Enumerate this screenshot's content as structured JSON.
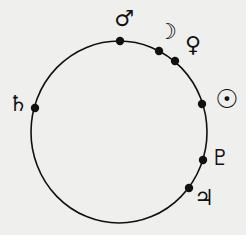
{
  "diagram": {
    "background": "#efefed",
    "ink_color": "#111111",
    "orbit": {
      "cx": 119,
      "cy": 132,
      "rx": 88,
      "ry": 91,
      "stroke_width": 1.6
    },
    "bodies": [
      {
        "name": "Mars",
        "icon": "mars-icon",
        "symbol": "♂",
        "dot": [
          120,
          41
        ],
        "label_pos": [
          124,
          19
        ],
        "size": 22
      },
      {
        "name": "Moon",
        "icon": "moon-icon",
        "symbol": "☽",
        "dot": [
          159,
          51
        ],
        "label_pos": [
          167,
          32
        ],
        "size": 22
      },
      {
        "name": "Venus",
        "icon": "venus-icon",
        "symbol": "♀",
        "dot": [
          175,
          61
        ],
        "label_pos": [
          193,
          45
        ],
        "size": 22
      },
      {
        "name": "Saturn",
        "icon": "saturn-icon",
        "symbol": "♄",
        "dot": [
          35,
          108
        ],
        "label_pos": [
          18,
          104
        ],
        "size": 22
      },
      {
        "name": "Sun",
        "icon": "sun-icon",
        "symbol": "☉",
        "dot": [
          202,
          104
        ],
        "label_pos": [
          227,
          99
        ],
        "size": 26
      },
      {
        "name": "Pluto",
        "icon": "pluto-icon",
        "symbol": "♇",
        "dot": [
          203,
          160
        ],
        "label_pos": [
          220,
          158
        ],
        "size": 22
      },
      {
        "name": "Jupiter",
        "icon": "jupiter-icon",
        "symbol": "♃",
        "dot": [
          189,
          188
        ],
        "label_pos": [
          204,
          198
        ],
        "size": 22
      }
    ]
  }
}
